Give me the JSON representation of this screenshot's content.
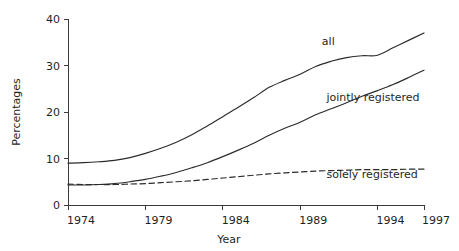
{
  "chart_data": {
    "type": "line",
    "title": "",
    "subtitle": "",
    "xlabel": "Year",
    "ylabel": "Percentages",
    "xlim": [
      1974,
      1997
    ],
    "ylim": [
      0,
      40
    ],
    "grid": false,
    "legend_position": "inline-annotation",
    "xticks": [
      1974,
      1979,
      1984,
      1989,
      1994,
      1997
    ],
    "xtick_labels": [
      "1974",
      "1979",
      "1984",
      "1989",
      "1994",
      "1997"
    ],
    "yticks": [
      0,
      10,
      20,
      30,
      40
    ],
    "ytick_labels": [
      "0",
      "10",
      "20",
      "30",
      "40"
    ],
    "x": [
      1974,
      1975,
      1976,
      1977,
      1978,
      1979,
      1980,
      1981,
      1982,
      1983,
      1984,
      1985,
      1986,
      1987,
      1988,
      1989,
      1990,
      1991,
      1992,
      1993,
      1994,
      1995,
      1996,
      1997
    ],
    "series": [
      {
        "name": "all",
        "style": "solid",
        "label": "all",
        "label_x": 1990.4,
        "label_y": 34.5,
        "values": [
          9.0,
          9.1,
          9.3,
          9.6,
          10.2,
          11.1,
          12.2,
          13.5,
          15.1,
          17.0,
          19.0,
          21.0,
          23.1,
          25.3,
          26.8,
          28.1,
          29.8,
          30.9,
          31.7,
          32.1,
          32.2,
          33.8,
          35.4,
          37.0
        ]
      },
      {
        "name": "jointly registered",
        "style": "solid",
        "label": "jointly registered",
        "label_x": 1990.7,
        "label_y": 22.4,
        "values": [
          4.3,
          4.3,
          4.4,
          4.6,
          5.0,
          5.5,
          6.2,
          7.0,
          8.0,
          9.1,
          10.4,
          11.8,
          13.3,
          15.0,
          16.5,
          17.8,
          19.4,
          20.7,
          22.0,
          23.4,
          24.6,
          25.9,
          27.4,
          29.0
        ]
      },
      {
        "name": "solely registered",
        "style": "dashed",
        "label": "solely registered",
        "label_x": 1990.7,
        "label_y": 5.7,
        "values": [
          4.5,
          4.4,
          4.4,
          4.4,
          4.5,
          4.6,
          4.8,
          5.0,
          5.2,
          5.5,
          5.8,
          6.1,
          6.4,
          6.7,
          6.9,
          7.1,
          7.3,
          7.4,
          7.5,
          7.6,
          7.6,
          7.6,
          7.7,
          7.7
        ]
      }
    ]
  },
  "colors": {
    "line": "#2b2b2b",
    "axis": "#3b3b3b",
    "text": "#1f1f1f",
    "background": "#ffffff"
  }
}
